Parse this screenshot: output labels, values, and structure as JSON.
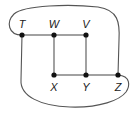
{
  "diagram": {
    "type": "graph",
    "nodes": [
      {
        "id": "T",
        "label": "T"
      },
      {
        "id": "W",
        "label": "W"
      },
      {
        "id": "V",
        "label": "V"
      },
      {
        "id": "X",
        "label": "X"
      },
      {
        "id": "Y",
        "label": "Y"
      },
      {
        "id": "Z",
        "label": "Z"
      }
    ],
    "edges": [
      {
        "from": "T",
        "to": "W",
        "kind": "straight"
      },
      {
        "from": "W",
        "to": "V",
        "kind": "straight"
      },
      {
        "from": "W",
        "to": "X",
        "kind": "straight"
      },
      {
        "from": "V",
        "to": "Y",
        "kind": "straight"
      },
      {
        "from": "X",
        "to": "Y",
        "kind": "straight"
      },
      {
        "from": "Y",
        "to": "Z",
        "kind": "straight"
      },
      {
        "from": "T",
        "to": "Z",
        "kind": "curved-top"
      },
      {
        "from": "T",
        "to": "Z",
        "kind": "curved-bottom"
      }
    ],
    "colors": {
      "edge": "#555555",
      "node": "#111111",
      "label": "#222222"
    }
  }
}
